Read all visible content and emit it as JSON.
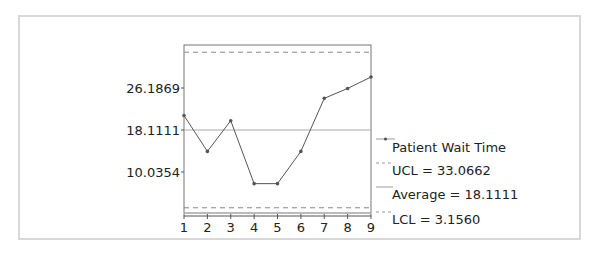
{
  "chart_data": {
    "type": "line",
    "title": "",
    "xlabel": "",
    "ylabel": "",
    "x": [
      1,
      2,
      3,
      4,
      5,
      6,
      7,
      8,
      9
    ],
    "x_tick_labels": [
      "1",
      "2",
      "3",
      "4",
      "5",
      "6",
      "7",
      "8",
      "9"
    ],
    "y_tick_values": [
      26.1869,
      18.1111,
      10.0354
    ],
    "y_tick_labels": [
      "26.1869",
      "18.1111",
      "10.0354"
    ],
    "ylim": [
      2.4,
      35.3
    ],
    "xlim": [
      1,
      9
    ],
    "grid": false,
    "series": [
      {
        "name": "Patient Wait Time",
        "values": [
          20.9,
          14.0,
          19.9,
          7.8,
          7.8,
          14.0,
          24.2,
          26.1,
          28.3
        ],
        "color": "#555555",
        "style": "solid-with-markers"
      }
    ],
    "reference_lines": [
      {
        "name": "UCL",
        "value": 33.0662,
        "style": "dashed",
        "label": "UCL = 33.0662"
      },
      {
        "name": "Average",
        "value": 18.1111,
        "style": "solid",
        "label": "Average = 18.1111"
      },
      {
        "name": "LCL",
        "value": 3.156,
        "style": "dashed",
        "label": "LCL = 3.1560"
      }
    ],
    "legend": {
      "placement": "right",
      "entries": [
        "Patient Wait Time",
        "UCL = 33.0662",
        "Average = 18.1111",
        "LCL = 3.1560"
      ]
    }
  }
}
